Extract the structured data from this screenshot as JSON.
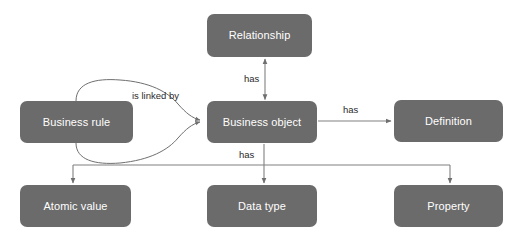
{
  "diagram": {
    "type": "entity-relationship",
    "background_color": "#ffffff",
    "node_color": "#6b6b6b",
    "node_text_color": "#ffffff",
    "edge_color": "#808080",
    "label_text_color": "#2b2b2b"
  },
  "nodes": [
    {
      "id": "relationship",
      "label": "Relationship",
      "x": 207,
      "y": 14,
      "w": 105,
      "h": 43
    },
    {
      "id": "business-rule",
      "label": "Business rule",
      "x": 20,
      "y": 101,
      "w": 113,
      "h": 42
    },
    {
      "id": "business-object",
      "label": "Business object",
      "x": 207,
      "y": 101,
      "w": 110,
      "h": 42
    },
    {
      "id": "definition",
      "label": "Definition",
      "x": 394,
      "y": 100,
      "w": 109,
      "h": 42
    },
    {
      "id": "atomic-value",
      "label": "Atomic value",
      "x": 20,
      "y": 185,
      "w": 111,
      "h": 42
    },
    {
      "id": "data-type",
      "label": "Data type",
      "x": 207,
      "y": 185,
      "w": 110,
      "h": 42
    },
    {
      "id": "property",
      "label": "Property",
      "x": 394,
      "y": 185,
      "w": 109,
      "h": 42
    }
  ],
  "edges": [
    {
      "id": "business-object-has-relationship",
      "from": "business-object",
      "to": "relationship",
      "label": "has",
      "label_x": 244,
      "label_y": 74,
      "arrow": "double"
    },
    {
      "id": "business-rule-is-linked-by-business-object",
      "from": "business-rule",
      "to": "business-object",
      "label": "is linked by",
      "label_x": 132,
      "label_y": 91,
      "arrow": "single"
    },
    {
      "id": "business-object-has-definition",
      "from": "business-object",
      "to": "definition",
      "label": "has",
      "label_x": 343,
      "label_y": 105,
      "arrow": "single"
    },
    {
      "id": "business-object-has-children",
      "from": "business-object",
      "to": "atomic-value, data-type, property",
      "label": "has",
      "label_x": 239,
      "label_y": 150,
      "arrow": "single"
    }
  ]
}
